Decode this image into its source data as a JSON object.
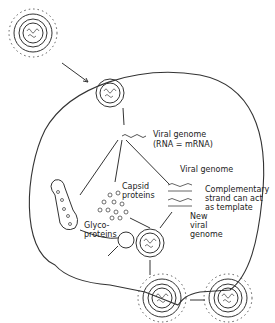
{
  "diagram": {
    "labels": {
      "viral_genome_top": "Viral genome",
      "rna_mrna": "(RNA = mRNA)",
      "capsid_1": "Capsid",
      "capsid_2": "proteins",
      "viral_genome_right": "Viral genome",
      "complementary_1": "Complementary",
      "complementary_2": "strand can act",
      "complementary_3": "as template",
      "new_1": "New",
      "new_2": "viral",
      "new_3": "genome",
      "glyco_1": "Glyco-",
      "glyco_2": "proteins"
    },
    "colors": {
      "line": "#333333",
      "background": "#ffffff"
    }
  }
}
